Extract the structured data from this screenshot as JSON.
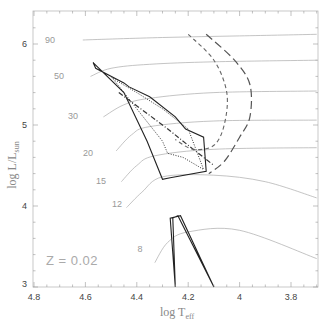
{
  "chart_data": {
    "type": "line",
    "title": "",
    "xlabel": "log T_eff",
    "ylabel": "log L/L_sun",
    "xlim": [
      4.8,
      3.7
    ],
    "ylim": [
      3,
      6.4
    ],
    "x_inverted": true,
    "grid": false,
    "x_ticks": [
      "4.8",
      "4.6",
      "4.4",
      "4.2",
      "4",
      "3.8"
    ],
    "y_ticks": [
      "3",
      "4",
      "5",
      "6"
    ],
    "annotation": "Z = 0.02",
    "mass_track_labels": [
      "90",
      "50",
      "30",
      "20",
      "15",
      "12",
      "8"
    ],
    "series": [
      {
        "name": "90 Msun track",
        "style": "thin grey",
        "x": [
          4.61,
          4.3,
          4.0,
          3.7
        ],
        "y": [
          6.05,
          6.08,
          6.1,
          6.12
        ]
      },
      {
        "name": "50 Msun track",
        "style": "thin grey",
        "x": [
          4.58,
          4.5,
          4.35,
          4.1,
          3.7
        ],
        "y": [
          5.6,
          5.7,
          5.75,
          5.78,
          5.8
        ]
      },
      {
        "name": "30 Msun track",
        "style": "thin grey",
        "x": [
          4.53,
          4.45,
          4.35,
          4.1,
          3.7
        ],
        "y": [
          5.1,
          5.25,
          5.33,
          5.4,
          5.42
        ]
      },
      {
        "name": "20 Msun track",
        "style": "thin grey",
        "x": [
          4.48,
          4.42,
          4.35,
          4.1,
          3.7
        ],
        "y": [
          4.68,
          4.88,
          4.98,
          5.05,
          5.06
        ]
      },
      {
        "name": "15 Msun track",
        "style": "thin grey",
        "x": [
          4.46,
          4.4,
          4.33,
          4.1,
          3.7
        ],
        "y": [
          4.3,
          4.5,
          4.62,
          4.7,
          4.72
        ]
      },
      {
        "name": "12 Msun track",
        "style": "thin grey",
        "x": [
          4.44,
          4.38,
          4.3,
          4.1,
          3.9,
          3.7
        ],
        "y": [
          3.98,
          4.17,
          4.36,
          4.38,
          4.3,
          4.1
        ]
      },
      {
        "name": "8 Msun track",
        "style": "thin grey",
        "x": [
          4.33,
          4.28,
          4.2,
          4.0,
          3.7
        ],
        "y": [
          3.3,
          3.55,
          3.68,
          3.7,
          3.35
        ]
      },
      {
        "name": "solid boundary (upper)",
        "style": "solid black",
        "x": [
          4.57,
          4.56,
          4.45,
          4.43,
          4.35,
          4.25,
          4.21,
          4.14,
          4.13,
          4.27,
          4.3,
          4.36,
          4.45,
          4.57
        ],
        "y": [
          5.77,
          5.7,
          5.52,
          5.47,
          5.35,
          5.1,
          4.95,
          4.85,
          4.43,
          4.35,
          4.33,
          4.8,
          5.4,
          5.77
        ]
      },
      {
        "name": "solid boundary (lower)",
        "style": "solid black",
        "x": [
          4.25,
          4.27,
          4.23,
          4.1,
          4.24,
          4.26,
          4.25
        ],
        "y": [
          3.0,
          3.85,
          3.88,
          3.0,
          3.88,
          3.85,
          3.0
        ]
      },
      {
        "name": "dotted curve",
        "style": "dotted black",
        "x": [
          4.5,
          4.48,
          4.4,
          4.3,
          4.2,
          4.14,
          4.22,
          4.28,
          4.3,
          4.5
        ],
        "y": [
          5.6,
          5.55,
          5.4,
          5.2,
          4.95,
          4.45,
          4.6,
          4.65,
          4.8,
          5.6
        ]
      },
      {
        "name": "dash-dot line",
        "style": "dash-dot black",
        "x": [
          4.47,
          4.3,
          4.2,
          4.1
        ],
        "y": [
          5.4,
          5.0,
          4.75,
          4.5
        ]
      },
      {
        "name": "short-dashed curve",
        "style": "dashed grey",
        "x": [
          4.2,
          4.1,
          4.05,
          4.06,
          4.1,
          4.18,
          4.25
        ],
        "y": [
          6.12,
          5.8,
          5.4,
          5.0,
          4.75,
          4.7,
          4.82
        ]
      },
      {
        "name": "long-dashed curve",
        "style": "long-dashed grey",
        "x": [
          4.13,
          4.02,
          3.96,
          3.96,
          4.0,
          4.06,
          4.12
        ],
        "y": [
          6.12,
          5.8,
          5.5,
          5.1,
          4.85,
          4.55,
          4.4
        ]
      }
    ]
  }
}
